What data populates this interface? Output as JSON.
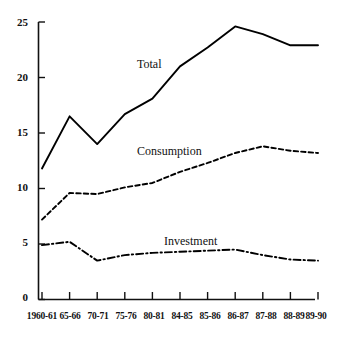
{
  "chart_data": {
    "type": "line",
    "title": "",
    "subtitle": "",
    "xlabel": "",
    "ylabel": "",
    "grid": false,
    "legend_position": "inline-annotations",
    "categories": [
      "1960-61",
      "65-66",
      "70-71",
      "75-76",
      "80-81",
      "84-85",
      "85-86",
      "86-87",
      "87-88",
      "88-89",
      "89-90"
    ],
    "ylim": [
      0,
      25
    ],
    "yticks": [
      0,
      5,
      10,
      15,
      20,
      25
    ],
    "ytick_labels": [
      "0",
      "5",
      "10",
      "15",
      "20",
      "25"
    ],
    "series": [
      {
        "name": "Total",
        "style": "solid",
        "color": "#000000",
        "values": [
          11.8,
          16.5,
          14.0,
          16.7,
          18.1,
          21.0,
          22.7,
          24.6,
          23.9,
          22.9,
          22.9
        ]
      },
      {
        "name": "Consumption",
        "style": "dashed",
        "color": "#000000",
        "values": [
          7.2,
          9.6,
          9.5,
          10.1,
          10.5,
          11.5,
          12.3,
          13.2,
          13.8,
          13.4,
          13.2
        ]
      },
      {
        "name": "Investment",
        "style": "dash-dot",
        "color": "#000000",
        "values": [
          4.9,
          5.2,
          3.5,
          4.0,
          4.2,
          4.3,
          4.4,
          4.5,
          4.0,
          3.6,
          3.5
        ]
      }
    ],
    "annotations": [
      {
        "text": "Total",
        "x_px": 137,
        "y_px": 58
      },
      {
        "text": "Consumption",
        "x_px": 137,
        "y_px": 145
      },
      {
        "text": "Investment",
        "x_px": 164,
        "y_px": 235
      }
    ]
  },
  "axes": {
    "y_tick_0": "0",
    "y_tick_1": "5",
    "y_tick_2": "10",
    "y_tick_3": "15",
    "y_tick_4": "20",
    "y_tick_5": "25",
    "x_tick_0": "1960-61",
    "x_tick_1": "65-66",
    "x_tick_2": "70-71",
    "x_tick_3": "75-76",
    "x_tick_4": "80-81",
    "x_tick_5": "84-85",
    "x_tick_6": "85-86",
    "x_tick_7": "86-87",
    "x_tick_8": "87-88",
    "x_tick_9": "88-89",
    "x_tick_10": "89-90"
  },
  "series_labels": {
    "total": "Total",
    "consumption": "Consumption",
    "investment": "Investment"
  }
}
